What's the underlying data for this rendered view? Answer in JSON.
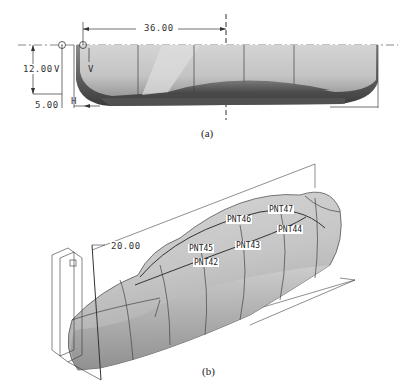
{
  "figure_a": {
    "caption": "(a)",
    "dimensions": {
      "horizontal": "36.00",
      "vertical": "12.00",
      "vertical_label": "V",
      "offset": "5.00",
      "offset_label": "H",
      "inner_label": "V"
    }
  },
  "figure_b": {
    "caption": "(b)",
    "dimension": "20.00",
    "points": [
      "PNT42",
      "PNT43",
      "PNT44",
      "PNT45",
      "PNT46",
      "PNT47"
    ]
  },
  "colors": {
    "surface": "#c8c8c8",
    "surface_dark": "#5a5a5a",
    "line": "#333333"
  }
}
